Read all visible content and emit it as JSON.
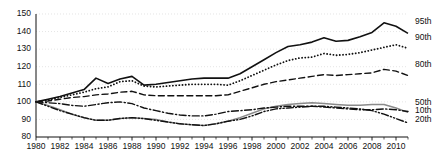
{
  "chart_data": {
    "type": "line",
    "title": "",
    "subtitle": "",
    "xlabel": "",
    "ylabel": "",
    "xlim": [
      1980,
      2011
    ],
    "ylim": [
      80,
      150
    ],
    "grid": true,
    "grid_orientation": "horizontal",
    "legend_position": "right-inline",
    "x_tick_labels": [
      "1980",
      "1982",
      "1984",
      "1986",
      "1988",
      "1990",
      "1992",
      "1994",
      "1996",
      "1998",
      "2000",
      "2002",
      "2004",
      "2006",
      "2008",
      "2010"
    ],
    "x_tick_values": [
      1980,
      1982,
      1984,
      1986,
      1988,
      1990,
      1992,
      1994,
      1996,
      1998,
      2000,
      2002,
      2004,
      2006,
      2008,
      2010
    ],
    "x_minor_tick_values": [
      1981,
      1983,
      1985,
      1987,
      1989,
      1991,
      1993,
      1995,
      1997,
      1999,
      2001,
      2003,
      2005,
      2007,
      2009,
      2011
    ],
    "y_tick_labels": [
      "80",
      "90",
      "100",
      "110",
      "120",
      "130",
      "140",
      "150"
    ],
    "y_tick_values": [
      80,
      90,
      100,
      110,
      120,
      130,
      140,
      150
    ],
    "x": [
      1980,
      1981,
      1982,
      1983,
      1984,
      1985,
      1986,
      1987,
      1988,
      1989,
      1990,
      1991,
      1992,
      1993,
      1994,
      1995,
      1996,
      1997,
      1998,
      1999,
      2000,
      2001,
      2002,
      2003,
      2004,
      2005,
      2006,
      2007,
      2008,
      2009,
      2010,
      2011
    ],
    "series": [
      {
        "name": "95th",
        "label": "95th",
        "style": "solid",
        "color": "#111111",
        "width": 1.6,
        "label_value": 145.5,
        "values": [
          100.0,
          101.5,
          103.0,
          105.0,
          107.0,
          113.5,
          110.5,
          113.0,
          114.5,
          109.5,
          110.0,
          111.0,
          112.0,
          113.0,
          113.5,
          113.5,
          113.5,
          116.0,
          120.0,
          124.0,
          128.0,
          131.5,
          132.5,
          134.0,
          136.5,
          134.5,
          135.0,
          137.0,
          139.5,
          145.0,
          143.0,
          139.0
        ]
      },
      {
        "name": "90th",
        "label": "90th",
        "style": "dotted",
        "color": "#111111",
        "width": 1.8,
        "label_value": 136.5,
        "values": [
          100.0,
          101.0,
          102.5,
          104.0,
          105.5,
          107.5,
          108.5,
          111.5,
          112.0,
          109.0,
          108.5,
          109.0,
          109.5,
          110.0,
          110.0,
          110.0,
          109.5,
          112.0,
          115.0,
          118.0,
          121.0,
          123.5,
          125.0,
          125.5,
          127.5,
          126.5,
          127.0,
          128.0,
          129.5,
          131.0,
          132.5,
          130.5
        ]
      },
      {
        "name": "80th",
        "label": "80th",
        "style": "dashed",
        "color": "#111111",
        "width": 1.4,
        "label_value": 121.0,
        "values": [
          100.0,
          100.5,
          101.5,
          102.5,
          103.0,
          104.0,
          104.5,
          105.5,
          106.0,
          104.0,
          103.5,
          103.5,
          103.5,
          103.5,
          103.5,
          103.5,
          104.0,
          106.0,
          108.0,
          110.0,
          111.5,
          112.5,
          113.5,
          114.5,
          115.5,
          115.0,
          115.5,
          116.0,
          116.5,
          118.5,
          117.5,
          115.0
        ]
      },
      {
        "name": "50th",
        "label": "50th",
        "style": "solid-gray",
        "color": "#8a8a8a",
        "width": 1.5,
        "label_value": 99.5,
        "values": [
          100.0,
          98.0,
          95.5,
          93.0,
          91.0,
          89.5,
          89.5,
          90.5,
          91.0,
          90.5,
          90.0,
          88.5,
          87.5,
          87.0,
          86.5,
          87.5,
          89.0,
          91.0,
          93.5,
          96.0,
          97.5,
          98.5,
          99.0,
          99.5,
          99.0,
          98.5,
          98.0,
          98.0,
          98.5,
          98.5,
          96.5,
          94.0
        ]
      },
      {
        "name": "10th",
        "label": "10th",
        "style": "dashdot",
        "color": "#111111",
        "width": 1.4,
        "label_value": 95.0,
        "values": [
          100.0,
          99.5,
          99.0,
          98.0,
          97.5,
          98.5,
          99.5,
          100.0,
          99.0,
          96.5,
          95.0,
          93.5,
          92.5,
          92.0,
          92.0,
          93.0,
          94.5,
          95.0,
          95.5,
          96.5,
          97.0,
          97.5,
          97.5,
          97.5,
          97.0,
          96.5,
          96.0,
          95.5,
          95.5,
          96.0,
          95.5,
          94.5
        ]
      },
      {
        "name": "20th",
        "label": "20th",
        "style": "dashdotdot",
        "color": "#111111",
        "width": 1.4,
        "label_value": 90.0,
        "values": [
          100.0,
          97.5,
          95.0,
          93.0,
          91.0,
          89.5,
          89.5,
          90.5,
          91.0,
          90.5,
          89.5,
          88.5,
          87.5,
          87.0,
          86.5,
          87.5,
          89.0,
          90.0,
          92.0,
          94.5,
          96.0,
          96.5,
          97.0,
          97.5,
          97.5,
          97.0,
          96.5,
          96.0,
          95.0,
          93.0,
          90.5,
          88.0
        ]
      }
    ]
  },
  "axes": {
    "y_axis_name": "index-axis",
    "x_axis_name": "year-axis"
  },
  "colors": {
    "ink": "#111111",
    "gray_series": "#8a8a8a",
    "gridline": "#d8d8d8",
    "background": "#ffffff"
  }
}
